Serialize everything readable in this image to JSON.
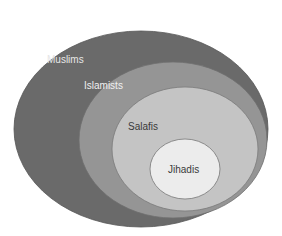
{
  "diagram": {
    "type": "nested-ellipses",
    "levels": [
      {
        "label": "Muslims",
        "fill": "#6a6a6a",
        "text_color": "#e6e6e6"
      },
      {
        "label": "Islamists",
        "fill": "#959595",
        "text_color": "#f0f0f0"
      },
      {
        "label": "Salafis",
        "fill": "#c4c4c4",
        "text_color": "#3a3a3a"
      },
      {
        "label": "Jihadis",
        "fill": "#ececec",
        "text_color": "#3a3a3a"
      }
    ]
  }
}
